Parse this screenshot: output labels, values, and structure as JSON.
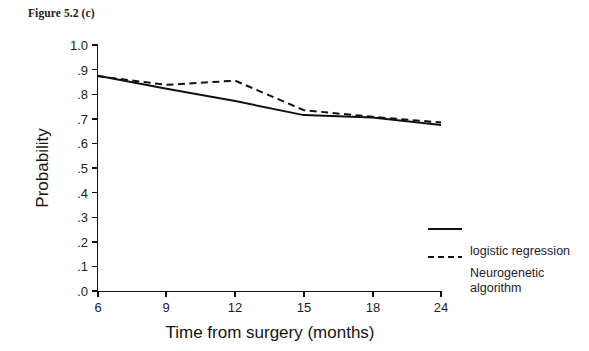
{
  "figure": {
    "title": "Figure 5.2 (c)"
  },
  "chart_data": {
    "type": "line",
    "title": "Figure 5.2 (c)",
    "xlabel": "Time from surgery (months)",
    "ylabel": "Probability",
    "categories": [
      "6",
      "9",
      "12",
      "15",
      "18",
      "24"
    ],
    "x": [
      6,
      9,
      12,
      15,
      18,
      24
    ],
    "xlim": [
      6,
      24
    ],
    "ylim": [
      0.0,
      1.0
    ],
    "ytick_labels": [
      "1.0",
      ".9",
      ".8",
      ".7",
      ".6",
      ".5",
      ".4",
      ".3",
      ".2",
      ".1",
      ".0"
    ],
    "ytick_values": [
      1.0,
      0.9,
      0.8,
      0.7,
      0.6,
      0.5,
      0.4,
      0.3,
      0.2,
      0.1,
      0.0
    ],
    "xtick_labels": [
      "6",
      "9",
      "12",
      "15",
      "18",
      "24"
    ],
    "grid": false,
    "legend_position": "right",
    "series": [
      {
        "name": "logistic regression",
        "style": "solid",
        "color": "#111111",
        "values": [
          0.875,
          0.822,
          0.772,
          0.715,
          0.705,
          0.675
        ]
      },
      {
        "name": "Neurogenetic algorithm",
        "style": "dashed",
        "color": "#111111",
        "values": [
          0.873,
          0.838,
          0.855,
          0.735,
          0.708,
          0.685
        ]
      }
    ]
  },
  "legend": {
    "entries": [
      {
        "label": "logistic regression",
        "style": "solid"
      },
      {
        "label": "Neurogenetic",
        "label_line2": "algorithm",
        "style": "dashed"
      }
    ],
    "item1_label": "logistic regression",
    "item2_label_line1": "Neurogenetic",
    "item2_label_line2": "algorithm"
  },
  "axes": {
    "y_title": "Probability",
    "x_title": "Time from surgery (months)"
  }
}
